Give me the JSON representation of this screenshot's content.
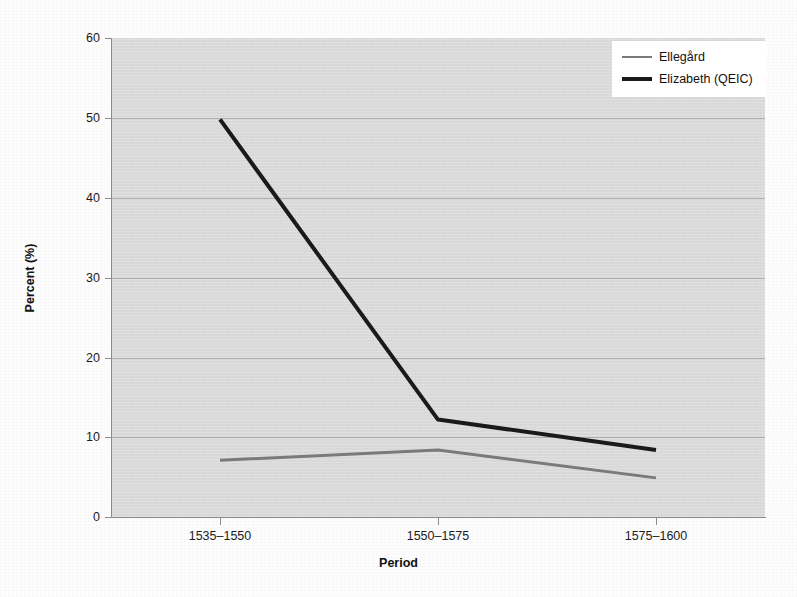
{
  "chart_data": {
    "type": "line",
    "title": "",
    "xlabel": "Period",
    "ylabel": "Percent (%)",
    "categories": [
      "1535–1550",
      "1550–1575",
      "1575–1600"
    ],
    "ylim": [
      0,
      60
    ],
    "yticks": [
      0,
      10,
      20,
      30,
      40,
      50,
      60
    ],
    "ytick_labels": [
      "0",
      "10",
      "20",
      "30",
      "40",
      "50",
      "60"
    ],
    "grid": true,
    "legend_position": "top-right",
    "series": [
      {
        "name": "Ellegård",
        "values": [
          7.1,
          8.4,
          4.9
        ],
        "color": "#7a7a7a",
        "width": 3
      },
      {
        "name": "Elizabeth (QEIC)",
        "values": [
          49.8,
          12.2,
          8.4
        ],
        "color": "#1a1a1a",
        "width": 4
      }
    ]
  },
  "plot": {
    "background_color": "#dadada",
    "axis_color": "#8b8b8b",
    "gridline_color": "#787878",
    "legend_background": "#ffffff"
  }
}
